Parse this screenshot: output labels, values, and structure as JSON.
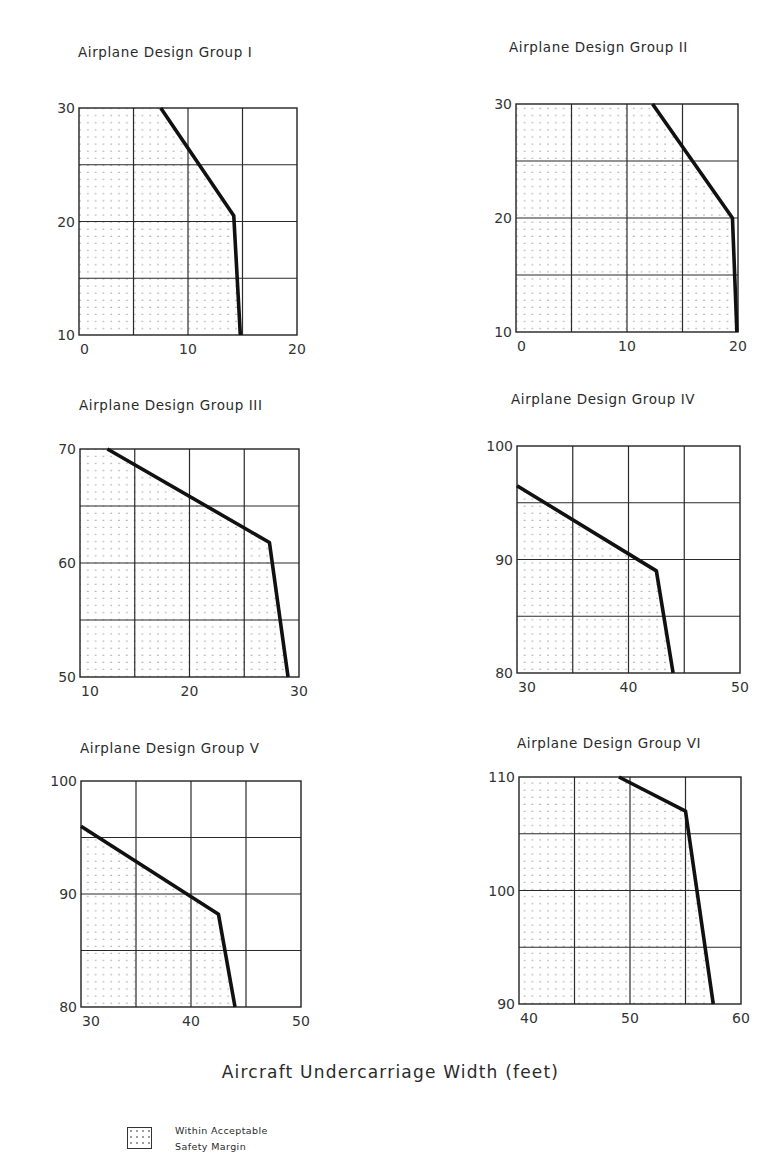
{
  "figure": {
    "xaxis_label": "Aircraft Undercarriage Width (feet)",
    "legend": {
      "line1": "Within Acceptable",
      "line2": "Safety Margin"
    }
  },
  "chart_data": [
    {
      "type": "area",
      "title": "Airplane Design Group I",
      "xlabel": "Aircraft Undercarriage Width (feet)",
      "ylabel": "",
      "xlim": [
        0,
        20
      ],
      "ylim": [
        10,
        30
      ],
      "xticks": [
        0,
        10,
        20
      ],
      "yticks": [
        10,
        20,
        30
      ],
      "grid": true,
      "grid_step_x": 5,
      "grid_step_y": 5,
      "boundary": {
        "x": [
          7.5,
          14.2,
          14.8
        ],
        "y": [
          30,
          20.5,
          10
        ]
      },
      "shaded_region": "left of boundary (Within Acceptable Safety Margin)",
      "box": {
        "left": 79,
        "top": 108,
        "right": 297,
        "bottom": 335
      },
      "title_pos": {
        "x": 78,
        "y": 57
      }
    },
    {
      "type": "area",
      "title": "Airplane Design Group II",
      "xlabel": "Aircraft Undercarriage Width (feet)",
      "ylabel": "",
      "xlim": [
        0,
        20
      ],
      "ylim": [
        10,
        30
      ],
      "xticks": [
        0,
        10,
        20
      ],
      "yticks": [
        10,
        20,
        30
      ],
      "grid": true,
      "grid_step_x": 5,
      "grid_step_y": 5,
      "boundary": {
        "x": [
          12.3,
          19.5,
          19.9
        ],
        "y": [
          30,
          20,
          10
        ]
      },
      "shaded_region": "left of boundary (Within Acceptable Safety Margin)",
      "box": {
        "left": 516,
        "top": 104,
        "right": 738,
        "bottom": 332
      },
      "title_pos": {
        "x": 509,
        "y": 52
      }
    },
    {
      "type": "area",
      "title": "Airplane Design Group III",
      "xlabel": "Aircraft Undercarriage Width (feet)",
      "ylabel": "",
      "xlim": [
        10,
        30
      ],
      "ylim": [
        50,
        70
      ],
      "xticks": [
        10,
        20,
        30
      ],
      "yticks": [
        50,
        60,
        70
      ],
      "grid": true,
      "grid_step_x": 5,
      "grid_step_y": 5,
      "boundary": {
        "x": [
          12.5,
          27.3,
          29.0
        ],
        "y": [
          70,
          61.8,
          50
        ]
      },
      "shaded_region": "left of boundary (Within Acceptable Safety Margin)",
      "box": {
        "left": 80,
        "top": 449,
        "right": 299,
        "bottom": 677
      },
      "title_pos": {
        "x": 79,
        "y": 410
      }
    },
    {
      "type": "area",
      "title": "Airplane Design Group IV",
      "xlabel": "Aircraft Undercarriage Width (feet)",
      "ylabel": "",
      "xlim": [
        30,
        50
      ],
      "ylim": [
        80,
        100
      ],
      "xticks": [
        30,
        40,
        50
      ],
      "yticks": [
        80,
        90,
        100
      ],
      "grid": true,
      "grid_step_x": 5,
      "grid_step_y": 5,
      "boundary": {
        "x": [
          30,
          42.5,
          44
        ],
        "y": [
          96.5,
          89,
          80
        ]
      },
      "shaded_region": "left of boundary (Within Acceptable Safety Margin)",
      "box": {
        "left": 517,
        "top": 446,
        "right": 740,
        "bottom": 673
      },
      "title_pos": {
        "x": 511,
        "y": 404
      }
    },
    {
      "type": "area",
      "title": "Airplane Design Group V",
      "xlabel": "Aircraft Undercarriage Width (feet)",
      "ylabel": "",
      "xlim": [
        30,
        50
      ],
      "ylim": [
        80,
        100
      ],
      "xticks": [
        30,
        40,
        50
      ],
      "yticks": [
        80,
        90,
        100
      ],
      "grid": true,
      "grid_step_x": 5,
      "grid_step_y": 5,
      "boundary": {
        "x": [
          30,
          42.5,
          44
        ],
        "y": [
          96,
          88.2,
          80
        ]
      },
      "shaded_region": "left of boundary (Within Acceptable Safety Margin)",
      "box": {
        "left": 81,
        "top": 781,
        "right": 301,
        "bottom": 1007
      },
      "title_pos": {
        "x": 80,
        "y": 753
      }
    },
    {
      "type": "area",
      "title": "Airplane Design Group VI",
      "xlabel": "Aircraft Undercarriage Width (feet)",
      "ylabel": "",
      "xlim": [
        40,
        60
      ],
      "ylim": [
        90,
        110
      ],
      "xticks": [
        40,
        50,
        60
      ],
      "yticks": [
        90,
        100,
        110
      ],
      "grid": true,
      "grid_step_x": 5,
      "grid_step_y": 5,
      "boundary": {
        "x": [
          49,
          55,
          57.5
        ],
        "y": [
          110,
          107,
          90
        ]
      },
      "shaded_region": "left of boundary (Within Acceptable Safety Margin)",
      "box": {
        "left": 519,
        "top": 777,
        "right": 741,
        "bottom": 1004
      },
      "title_pos": {
        "x": 517,
        "y": 748
      }
    }
  ]
}
